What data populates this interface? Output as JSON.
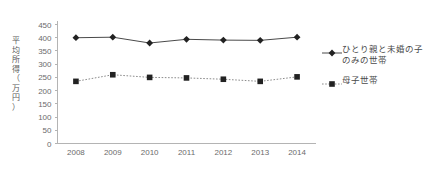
{
  "chart_data": {
    "type": "line",
    "title": "",
    "xlabel": "",
    "ylabel": "平均所得（万円）",
    "categories": [
      "2008",
      "2009",
      "2010",
      "2011",
      "2012",
      "2013",
      "2014"
    ],
    "ylim": [
      0,
      450
    ],
    "ytick_step": 50,
    "yticks": [
      "450",
      "400",
      "350",
      "300",
      "250",
      "200",
      "150",
      "100",
      "50",
      "0"
    ],
    "grid": false,
    "legend_position": "right",
    "series": [
      {
        "name": "ひとり親と未婚の子のみの世帯",
        "marker": "diamond",
        "line_style": "solid",
        "color": "#222222",
        "values": [
          400,
          402,
          380,
          394,
          391,
          390,
          402
        ]
      },
      {
        "name": "母子世帯",
        "marker": "square",
        "line_style": "dotted",
        "color": "#222222",
        "values": [
          235,
          260,
          250,
          248,
          243,
          235,
          252
        ]
      }
    ]
  },
  "axis_title_chars": [
    "平",
    "均",
    "所",
    "得",
    "（",
    "万",
    "円",
    "）"
  ],
  "colors": {
    "axis": "#b4b4b4",
    "tick_text": "#6b6b6b",
    "series_primary": "#4a4a4a",
    "series_secondary": "#8c8c8c",
    "marker": "#222222",
    "background": "#ffffff"
  }
}
